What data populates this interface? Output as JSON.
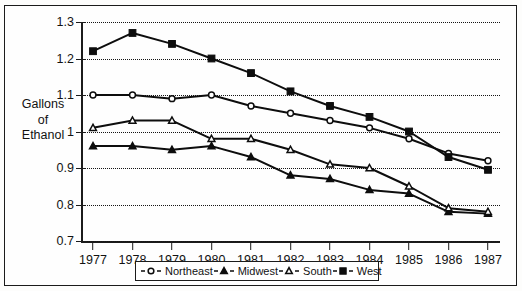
{
  "top_strip_text": "",
  "chart_data": {
    "type": "line",
    "title": "",
    "xlabel": "",
    "ylabel": "Gallons of Ethanol",
    "ylabel_lines": [
      "Gallons",
      "of",
      "Ethanol"
    ],
    "categories": [
      "1977",
      "1978",
      "1979",
      "1980",
      "1981",
      "1982",
      "1983",
      "1984",
      "1985",
      "1986",
      "1987"
    ],
    "x": [
      1977,
      1978,
      1979,
      1980,
      1981,
      1982,
      1983,
      1984,
      1985,
      1986,
      1987
    ],
    "ylim": [
      0.7,
      1.3
    ],
    "yticks": [
      0.7,
      0.8,
      0.9,
      1.0,
      1.1,
      1.2,
      1.3
    ],
    "ytick_labels": [
      "0.7",
      "0.8",
      "0.9",
      "1",
      "1.1",
      "1.2",
      "1.3"
    ],
    "grid": true,
    "grid_style": "dotted-horizontal",
    "legend_position": "bottom",
    "series": [
      {
        "name": "Northeast",
        "marker": "open-circle",
        "values": [
          1.1,
          1.1,
          1.09,
          1.1,
          1.07,
          1.05,
          1.03,
          1.01,
          0.98,
          0.94,
          0.92
        ]
      },
      {
        "name": "Midwest",
        "marker": "filled-triangle",
        "values": [
          0.96,
          0.96,
          0.95,
          0.96,
          0.93,
          0.88,
          0.87,
          0.84,
          0.83,
          0.78,
          0.775
        ]
      },
      {
        "name": "South",
        "marker": "open-triangle",
        "values": [
          1.01,
          1.03,
          1.03,
          0.98,
          0.98,
          0.95,
          0.91,
          0.9,
          0.85,
          0.79,
          0.78
        ]
      },
      {
        "name": "West",
        "marker": "filled-square",
        "values": [
          1.22,
          1.27,
          1.24,
          1.2,
          1.16,
          1.11,
          1.07,
          1.04,
          1.0,
          0.93,
          0.895
        ]
      }
    ]
  },
  "colors": {
    "ink": "#121212",
    "frame": "#1b1b1b",
    "background": "#fefefe"
  }
}
